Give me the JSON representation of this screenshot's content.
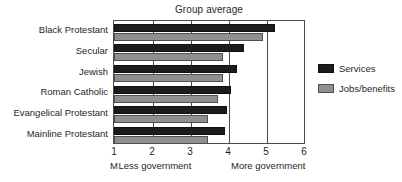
{
  "chart_data": {
    "type": "bar",
    "orientation": "horizontal",
    "title": "Group average",
    "xlabel": "",
    "ylabel": "",
    "xlim": [
      1,
      6
    ],
    "xticks": [
      1,
      2,
      3,
      4,
      5,
      6
    ],
    "xtick_labels": [
      "1",
      "2",
      "3",
      "4",
      "5",
      "6"
    ],
    "grid": true,
    "grid_axis": "x",
    "legend_position": "right",
    "categories": [
      "Black Protestant",
      "Secular",
      "Jewish",
      "Roman Catholic",
      "Evangelical Protestant",
      "Mainline Protestant"
    ],
    "series": [
      {
        "name": "Services",
        "color": "#1c1c1c",
        "values": [
          5.2,
          4.4,
          4.2,
          4.05,
          3.95,
          3.9
        ]
      },
      {
        "name": "Jobs/benefits",
        "color": "#8f8f8f",
        "values": [
          4.9,
          3.85,
          3.85,
          3.7,
          3.45,
          3.45
        ]
      }
    ],
    "annotations": {
      "axis_caption_left_stray": "M",
      "axis_caption_left": "Less government",
      "axis_caption_right": "More government"
    }
  },
  "legend": {
    "items": [
      {
        "label": "Services",
        "swatch": "services"
      },
      {
        "label": "Jobs/benefits",
        "swatch": "jobs"
      }
    ]
  },
  "colors": {
    "services": "#1c1c1c",
    "jobs": "#8f8f8f",
    "axis": "#4a4a4a",
    "text": "#1f1f1f",
    "background": "#ffffff"
  }
}
